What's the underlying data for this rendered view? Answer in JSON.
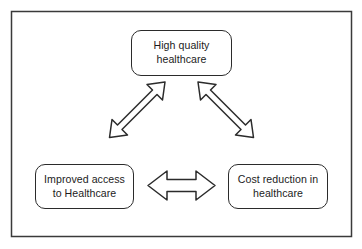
{
  "diagram": {
    "frame": {
      "stroke_color": "#3a3a3a",
      "fill_color": "#ffffff"
    },
    "style": {
      "box_stroke_color": "#2b2b2b",
      "box_fill_color": "#ffffff",
      "arrow_stroke_color": "#2b2b2b",
      "arrow_fill_color": "#ffffff",
      "text_color": "#1c1c1c",
      "background_color": "#ffffff"
    },
    "nodes": [
      {
        "id": "quality",
        "label": "High quality\nhealthcare",
        "line1": "High quality",
        "line2": "healthcare",
        "position": "top-center"
      },
      {
        "id": "access",
        "label": "Improved access\nto Healthcare",
        "line1": "Improved access",
        "line2": "to Healthcare",
        "position": "bottom-left"
      },
      {
        "id": "cost",
        "label": "Cost reduction in\nhealthcare",
        "line1": "Cost reduction in",
        "line2": "healthcare",
        "position": "bottom-right"
      }
    ],
    "connectors": [
      {
        "id": "access-quality",
        "type": "double-headed-arrow",
        "orientation": "diagonal-up-right",
        "from": "access",
        "to": "quality",
        "bidirectional": true
      },
      {
        "id": "quality-cost",
        "type": "double-headed-arrow",
        "orientation": "diagonal-down-right",
        "from": "quality",
        "to": "cost",
        "bidirectional": true
      },
      {
        "id": "access-cost",
        "type": "double-headed-arrow",
        "orientation": "horizontal",
        "from": "access",
        "to": "cost",
        "bidirectional": true
      }
    ]
  }
}
